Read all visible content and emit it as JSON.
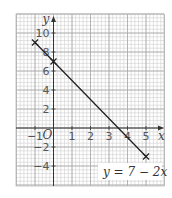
{
  "chart_data": {
    "type": "line",
    "title": "",
    "xlabel": "x",
    "ylabel": "y",
    "origin_label": "O",
    "xlim": [
      -2,
      6
    ],
    "ylim": [
      -6,
      12
    ],
    "grid": true,
    "x_ticks": [
      -1,
      1,
      2,
      3,
      4,
      5
    ],
    "x_tick_labels": [
      "−1",
      "1",
      "2",
      "3",
      "4",
      "5"
    ],
    "y_ticks": [
      -4,
      -2,
      2,
      4,
      6,
      8,
      10
    ],
    "y_tick_labels": [
      "−4",
      "−2",
      "2",
      "4",
      "6",
      "8",
      "10"
    ],
    "series": [
      {
        "name": "y = 7 − 2x",
        "x": [
          -1,
          0,
          5
        ],
        "y": [
          9,
          7,
          -3
        ],
        "markers": "x",
        "color": "#222222"
      }
    ],
    "annotations": [
      {
        "text": "y = 7 − 2x",
        "x": 3,
        "y": -4.5
      }
    ]
  }
}
